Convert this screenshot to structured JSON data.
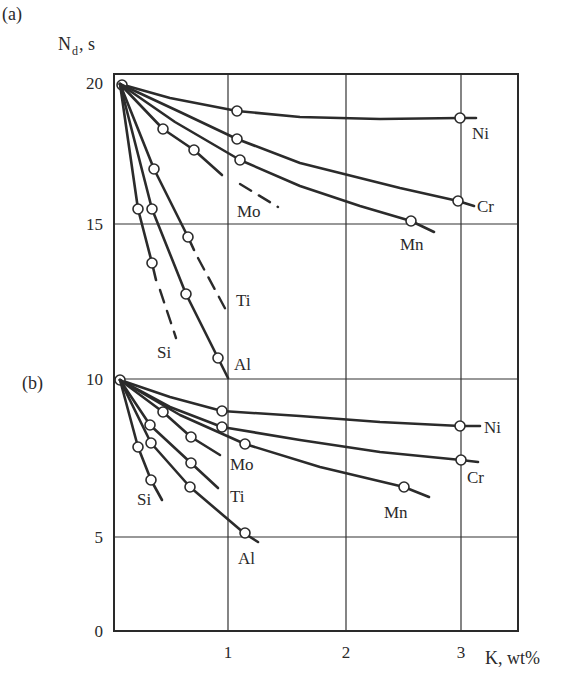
{
  "chart_data": [
    {
      "panel": "(a)",
      "type": "line",
      "title": "",
      "xlabel": "K, wt%",
      "ylabel": "N_d, s",
      "ylabel_main": "N",
      "ylabel_sub": "d",
      "ylabel_suffix": ", s",
      "xlim": [
        0,
        3.5
      ],
      "ylim": [
        10,
        20
      ],
      "x_ticks": [
        "1",
        "2",
        "3"
      ],
      "y_ticks": [
        "20",
        "15",
        "10"
      ],
      "grid": true,
      "series": [
        {
          "name": "Ni",
          "points": [
            [
              0,
              19.8
            ],
            [
              1.05,
              19.0
            ],
            [
              3.0,
              18.8
            ]
          ],
          "line_end": [
            3.15,
            18.8
          ]
        },
        {
          "name": "Cr",
          "points": [
            [
              0,
              19.8
            ],
            [
              1.05,
              18.1
            ],
            [
              3.0,
              16.0
            ]
          ],
          "line_end": [
            3.1,
            15.8
          ]
        },
        {
          "name": "Mn",
          "points": [
            [
              0,
              19.8
            ],
            [
              1.05,
              17.4
            ],
            [
              2.55,
              15.1
            ]
          ],
          "line_end": [
            2.8,
            14.7
          ]
        },
        {
          "name": "Mo",
          "points": [
            [
              0,
              19.8
            ],
            [
              0.43,
              18.3
            ],
            [
              0.68,
              17.6
            ]
          ],
          "line_end": [
            0.95,
            16.9
          ],
          "dashed_to": [
            1.4,
            16.1
          ]
        },
        {
          "name": "Ti",
          "points": [
            [
              0,
              19.8
            ],
            [
              0.35,
              17.0
            ],
            [
              0.65,
              14.6
            ]
          ],
          "line_end": [
            0.7,
            14.1
          ],
          "dashed_to": [
            0.98,
            12.3
          ]
        },
        {
          "name": "Al",
          "points": [
            [
              0,
              19.8
            ],
            [
              0.33,
              15.6
            ],
            [
              0.63,
              12.6
            ],
            [
              0.9,
              10.5
            ]
          ],
          "line_end": [
            0.99,
            9.9
          ]
        },
        {
          "name": "Si",
          "points": [
            [
              0,
              19.8
            ],
            [
              0.21,
              15.6
            ],
            [
              0.33,
              13.7
            ]
          ],
          "line_end": [
            0.37,
            13.1
          ],
          "dashed_to": [
            0.55,
            11.2
          ]
        }
      ]
    },
    {
      "panel": "(b)",
      "type": "line",
      "title": "",
      "xlabel": "K, wt%",
      "ylabel": "N_d, s",
      "xlim": [
        0,
        3.5
      ],
      "ylim": [
        0,
        10
      ],
      "x_ticks": [
        "1",
        "2",
        "3"
      ],
      "y_ticks": [
        "10",
        "5",
        "0"
      ],
      "grid": true,
      "series": [
        {
          "name": "Ni",
          "points": [
            [
              0,
              9.9
            ],
            [
              0.95,
              9.0
            ],
            [
              3.0,
              8.5
            ]
          ],
          "line_end": [
            3.15,
            8.5
          ]
        },
        {
          "name": "Cr",
          "points": [
            [
              0,
              9.9
            ],
            [
              0.95,
              8.5
            ],
            [
              3.0,
              7.5
            ]
          ],
          "line_end": [
            3.15,
            7.4
          ]
        },
        {
          "name": "Mn",
          "points": [
            [
              0,
              9.9
            ],
            [
              1.1,
              8.0
            ],
            [
              2.5,
              6.6
            ]
          ],
          "line_end": [
            2.7,
            6.4
          ]
        },
        {
          "name": "Mo",
          "points": [
            [
              0,
              9.9
            ],
            [
              0.38,
              8.9
            ],
            [
              0.62,
              8.2
            ]
          ],
          "line_end": [
            0.87,
            7.6
          ]
        },
        {
          "name": "Ti",
          "points": [
            [
              0,
              9.9
            ],
            [
              0.26,
              8.5
            ],
            [
              0.62,
              7.3
            ]
          ],
          "line_end": [
            0.86,
            6.6
          ]
        },
        {
          "name": "Al",
          "points": [
            [
              0,
              9.9
            ],
            [
              0.27,
              7.9
            ],
            [
              0.61,
              6.6
            ],
            [
              1.08,
              5.1
            ]
          ],
          "line_end": [
            1.2,
            4.8
          ]
        },
        {
          "name": "Si",
          "points": [
            [
              0,
              9.9
            ],
            [
              0.16,
              7.8
            ],
            [
              0.27,
              6.8
            ]
          ],
          "line_end": [
            0.38,
            6.2
          ]
        }
      ]
    }
  ],
  "labels": {
    "panel_a": "(a)",
    "panel_b": "(b)",
    "y_axis": "N",
    "y_axis_sub": "d",
    "y_axis_suffix": ", s",
    "x_axis": "K, wt%"
  },
  "render": {
    "x_ticks_px": [
      {
        "label": "1",
        "x": 228
      },
      {
        "label": "2",
        "x": 346
      },
      {
        "label": "3",
        "x": 461
      }
    ],
    "y_ticks_px": [
      {
        "label": "20",
        "y": 83
      },
      {
        "label": "15",
        "y": 224
      },
      {
        "label": "10",
        "y": 379
      },
      {
        "label": "5",
        "y": 537
      },
      {
        "label": "0",
        "y": 631
      }
    ],
    "frame": {
      "left": 114,
      "top": 74,
      "right": 518,
      "bottom": 631
    },
    "hgrid_px": [
      224,
      379,
      537
    ],
    "vgrid_px": [
      228,
      346,
      461
    ],
    "curves_a": [
      {
        "name": "Ni",
        "path": [
          [
            120,
            84
          ],
          [
            170,
            98
          ],
          [
            237,
            111
          ],
          [
            300,
            117
          ],
          [
            380,
            119
          ],
          [
            460,
            118
          ],
          [
            476,
            118
          ]
        ],
        "dots": [
          [
            122,
            85
          ],
          [
            237,
            111
          ],
          [
            460,
            118
          ]
        ],
        "label": [
          472,
          139
        ]
      },
      {
        "name": "Cr",
        "path": [
          [
            120,
            84
          ],
          [
            180,
            112
          ],
          [
            237,
            139
          ],
          [
            300,
            163
          ],
          [
            400,
            188
          ],
          [
            458,
            201
          ],
          [
            474,
            206
          ]
        ],
        "dots": [
          [
            237,
            139
          ],
          [
            458,
            201
          ]
        ],
        "label": [
          477,
          212
        ]
      },
      {
        "name": "Mn",
        "path": [
          [
            120,
            84
          ],
          [
            175,
            122
          ],
          [
            240,
            160
          ],
          [
            300,
            186
          ],
          [
            360,
            206
          ],
          [
            411,
            221
          ],
          [
            434,
            232
          ]
        ],
        "dots": [
          [
            240,
            160
          ],
          [
            411,
            221
          ]
        ],
        "label": [
          400,
          250
        ]
      },
      {
        "name": "Mo",
        "path": [
          [
            120,
            84
          ],
          [
            163,
            129
          ],
          [
            194,
            150
          ],
          [
            222,
            175
          ]
        ],
        "dots": [
          [
            163,
            129
          ],
          [
            194,
            150
          ]
        ],
        "dashed": [
          [
            240,
            184
          ],
          [
            278,
            207
          ]
        ],
        "label": [
          237,
          217
        ]
      },
      {
        "name": "Ti",
        "path": [
          [
            120,
            84
          ],
          [
            154,
            169
          ],
          [
            188,
            237
          ],
          [
            194,
            250
          ]
        ],
        "dots": [
          [
            154,
            169
          ],
          [
            188,
            237
          ]
        ],
        "dashed": [
          [
            198,
            258
          ],
          [
            227,
            312
          ]
        ],
        "label": [
          236,
          306
        ]
      },
      {
        "name": "Al",
        "path": [
          [
            120,
            84
          ],
          [
            152,
            209
          ],
          [
            186,
            294
          ],
          [
            218,
            358
          ],
          [
            228,
            378
          ]
        ],
        "dots": [
          [
            152,
            209
          ],
          [
            186,
            294
          ],
          [
            218,
            358
          ]
        ],
        "label": [
          234,
          370
        ]
      },
      {
        "name": "Si",
        "path": [
          [
            120,
            84
          ],
          [
            138,
            209
          ],
          [
            152,
            263
          ],
          [
            156,
            280
          ]
        ],
        "dots": [
          [
            138,
            209
          ],
          [
            152,
            263
          ]
        ],
        "dashed": [
          [
            160,
            290
          ],
          [
            176,
            338
          ]
        ],
        "label": [
          157,
          358
        ]
      }
    ],
    "curves_b": [
      {
        "name": "Ni",
        "path": [
          [
            120,
            380
          ],
          [
            170,
            397
          ],
          [
            222,
            411
          ],
          [
            300,
            416
          ],
          [
            380,
            422
          ],
          [
            460,
            426
          ],
          [
            480,
            426
          ]
        ],
        "dots": [
          [
            120,
            380
          ],
          [
            222,
            411
          ],
          [
            460,
            426
          ]
        ],
        "label": [
          484,
          433
        ]
      },
      {
        "name": "Cr",
        "path": [
          [
            120,
            380
          ],
          [
            170,
            407
          ],
          [
            222,
            427
          ],
          [
            300,
            440
          ],
          [
            380,
            452
          ],
          [
            461,
            460
          ],
          [
            478,
            462
          ]
        ],
        "dots": [
          [
            222,
            427
          ],
          [
            461,
            460
          ]
        ],
        "label": [
          467,
          483
        ]
      },
      {
        "name": "Mn",
        "path": [
          [
            120,
            380
          ],
          [
            180,
            415
          ],
          [
            245,
            444
          ],
          [
            320,
            467
          ],
          [
            404,
            487
          ],
          [
            429,
            497
          ]
        ],
        "dots": [
          [
            245,
            444
          ],
          [
            404,
            487
          ]
        ],
        "label": [
          384,
          518
        ]
      },
      {
        "name": "Mo",
        "path": [
          [
            120,
            380
          ],
          [
            163,
            412
          ],
          [
            191,
            437
          ],
          [
            220,
            455
          ]
        ],
        "dots": [
          [
            163,
            412
          ],
          [
            191,
            437
          ]
        ],
        "label": [
          230,
          470
        ]
      },
      {
        "name": "Ti",
        "path": [
          [
            120,
            380
          ],
          [
            150,
            425
          ],
          [
            191,
            463
          ],
          [
            218,
            488
          ]
        ],
        "dots": [
          [
            150,
            425
          ],
          [
            191,
            463
          ]
        ],
        "label": [
          230,
          502
        ]
      },
      {
        "name": "Al",
        "path": [
          [
            120,
            380
          ],
          [
            151,
            443
          ],
          [
            190,
            487
          ],
          [
            244,
            533
          ],
          [
            258,
            542
          ]
        ],
        "dots": [
          [
            151,
            443
          ],
          [
            190,
            487
          ],
          [
            245,
            533
          ]
        ],
        "label": [
          238,
          564
        ]
      },
      {
        "name": "Si",
        "path": [
          [
            120,
            380
          ],
          [
            138,
            447
          ],
          [
            151,
            480
          ],
          [
            162,
            500
          ]
        ],
        "dots": [
          [
            138,
            447
          ],
          [
            151,
            480
          ]
        ],
        "label": [
          137,
          505
        ]
      }
    ]
  }
}
